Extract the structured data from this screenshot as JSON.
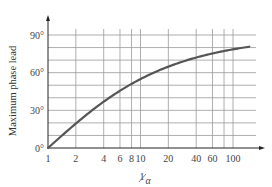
{
  "chart_data": {
    "type": "line",
    "title": "",
    "xlabel": "1/α",
    "ylabel": "Maximum phase lead",
    "xscale": "log",
    "xlim": [
      1,
      150
    ],
    "ylim": [
      0,
      90
    ],
    "grid": true,
    "legend": null,
    "x_ticks": [
      "1",
      "2",
      "4",
      "6",
      "8",
      "10",
      "20",
      "40",
      "60",
      "100"
    ],
    "x_tick_values": [
      1,
      2,
      4,
      6,
      8,
      10,
      20,
      40,
      60,
      100
    ],
    "x_gridlines": [
      1,
      2,
      4,
      6,
      8,
      10,
      20,
      40,
      60,
      80,
      100
    ],
    "y_ticks": [
      "0°",
      "30°",
      "60°",
      "90°"
    ],
    "y_tick_values": [
      0,
      30,
      60,
      90
    ],
    "y_gridlines": [
      10,
      20,
      30,
      40,
      50,
      60,
      70,
      80,
      90
    ],
    "series": [
      {
        "name": "Maximum phase lead",
        "x": [
          1,
          1.5,
          2,
          3,
          4,
          6,
          8,
          10,
          15,
          20,
          30,
          40,
          60,
          80,
          100,
          150
        ],
        "y": [
          0,
          11.5,
          19.5,
          30,
          36.9,
          45.6,
          51.1,
          54.9,
          61.0,
          64.8,
          69.3,
          72.2,
          75.2,
          77.2,
          78.6,
          80.6
        ]
      }
    ]
  },
  "axis_labels": {
    "y": "Maximum phase lead",
    "x_main": "1",
    "x_sub": "α"
  },
  "colors": {
    "curve": "#555555",
    "grid": "#9a9a9a",
    "axis": "#222222",
    "text": "#444444"
  }
}
